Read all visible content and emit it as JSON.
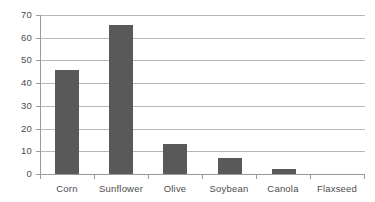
{
  "chart_data": {
    "type": "bar",
    "title": "",
    "subtitle": "",
    "xlabel": "",
    "ylabel": "",
    "categories": [
      "Corn",
      "Sunflower",
      "Olive",
      "Soybean",
      "Canola",
      "Flaxseed"
    ],
    "values": [
      46,
      65.5,
      13,
      7,
      2,
      0
    ],
    "ylim": [
      0,
      70
    ],
    "ytick_labels": [
      "0",
      "10",
      "20",
      "30",
      "40",
      "50",
      "60",
      "70"
    ],
    "ytick_values": [
      0,
      10,
      20,
      30,
      40,
      50,
      60,
      70
    ],
    "grid": true,
    "grid_axis": "y",
    "legend": false,
    "legend_position": "none",
    "annotations": [],
    "series": [
      {
        "name": "",
        "values": [
          46,
          65.5,
          13,
          7,
          2,
          0
        ]
      }
    ]
  },
  "style": {
    "bar_color": "#595959",
    "gridline_color": "#b7b7b7",
    "axis_color": "#9a9a9a",
    "tick_label_color": "#4d4d4d",
    "background_color": "#ffffff"
  }
}
